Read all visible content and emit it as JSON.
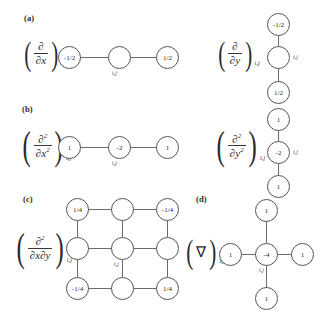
{
  "figure": {
    "background": "#ffffff",
    "node_stroke": "#555555",
    "edge_stroke": "#6a6a6a",
    "text_color": "#2b2b2b",
    "index_tag": "i,j"
  },
  "panels": {
    "a": {
      "label": "(a)",
      "left": {
        "operator_text": "(∂/∂x)i,j",
        "numerator": "∂",
        "denominator": "x",
        "denominator_prefix": "∂",
        "subscript": "i,j",
        "type": "horizontal-3",
        "nodes": [
          {
            "value": "-1/2",
            "position": "left"
          },
          {
            "value": "",
            "position": "center"
          },
          {
            "value": "1/2",
            "position": "right"
          }
        ],
        "center_tag": "i,j"
      },
      "right": {
        "operator_text": "(∂/∂y)i,j",
        "numerator": "∂",
        "denominator": "y",
        "denominator_prefix": "∂",
        "subscript": "i,j",
        "type": "vertical-3",
        "nodes": [
          {
            "value": "-1/2",
            "position": "top"
          },
          {
            "value": "",
            "position": "center"
          },
          {
            "value": "1/2",
            "position": "bottom"
          }
        ],
        "center_tag": "i,j"
      }
    },
    "b": {
      "label": "(b)",
      "left": {
        "operator_text": "(∂²/∂x²)i,j",
        "numerator": "∂",
        "numerator_sup": "2",
        "denominator_prefix": "∂",
        "denominator": "x",
        "denominator_sup": "2",
        "subscript": "i,j",
        "type": "horizontal-3",
        "nodes": [
          {
            "value": "1",
            "position": "left"
          },
          {
            "value": "-2",
            "position": "center"
          },
          {
            "value": "1",
            "position": "right"
          }
        ],
        "center_tag": "i,j"
      },
      "right": {
        "operator_text": "(∂²/∂y²)i,j",
        "numerator": "∂",
        "numerator_sup": "2",
        "denominator_prefix": "∂",
        "denominator": "y",
        "denominator_sup": "2",
        "subscript": "i,j",
        "type": "vertical-3",
        "nodes": [
          {
            "value": "1",
            "position": "top"
          },
          {
            "value": "-2",
            "position": "center"
          },
          {
            "value": "1",
            "position": "bottom"
          }
        ],
        "center_tag": "i,j"
      }
    },
    "c": {
      "label": "(c)",
      "left": {
        "operator_text": "(∂²/∂x∂y)i,j",
        "numerator": "∂",
        "numerator_sup": "2",
        "denominator_prefix": "∂",
        "denominator": "x∂y",
        "subscript": "i,j",
        "type": "grid-3x3",
        "grid": [
          [
            "1/4",
            "",
            "-1/4"
          ],
          [
            "",
            "",
            ""
          ],
          [
            "-1/4",
            "",
            "1/4"
          ]
        ],
        "center_tag": "i,j"
      }
    },
    "d": {
      "label": "(d)",
      "left": {
        "operator_text": "(∇)i,j",
        "symbol": "∇",
        "subscript": "i,j",
        "type": "cross-5",
        "nodes": [
          {
            "value": "1",
            "position": "top"
          },
          {
            "value": "1",
            "position": "left"
          },
          {
            "value": "-4",
            "position": "center"
          },
          {
            "value": "1",
            "position": "right"
          },
          {
            "value": "1",
            "position": "bottom"
          }
        ],
        "center_tag": "i,j"
      }
    }
  }
}
